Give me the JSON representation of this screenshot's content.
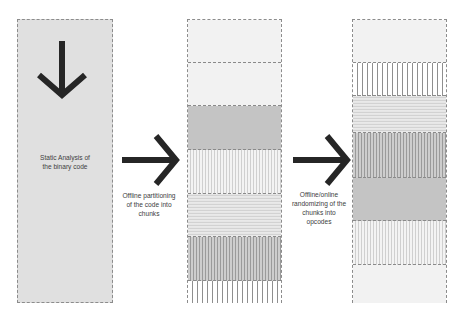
{
  "stages": [
    {
      "label": "Static Analysis of the binary code",
      "label_lines": [
        "Static Analysis of",
        "the binary code"
      ]
    },
    {
      "label": "Offline partitioning of the code into chunks",
      "label_lines": [
        "Offline partitioning",
        "of the code into",
        "chunks"
      ]
    },
    {
      "label": "Offline/online randomizing of the chunks into opcodes",
      "label_lines": [
        "Offline/online",
        "randomizing of the",
        "chunks into",
        "opcodes"
      ]
    }
  ],
  "columns": {
    "binary": {
      "fill": "#e0e0e0",
      "border": "#8c8c8c"
    },
    "chunks": {
      "segments": [
        "plain-light",
        "plain-light",
        "plain-mid",
        "vlines-light",
        "hlines",
        "vlines-dark",
        "vlines-wide"
      ]
    },
    "opcodes": {
      "segments": [
        "plain-light",
        "vlines-wide",
        "hlines",
        "vlines-dark",
        "plain-mid",
        "vlines-light",
        "plain-light"
      ]
    }
  },
  "colors": {
    "arrow": "#262626",
    "text": "#404040"
  }
}
